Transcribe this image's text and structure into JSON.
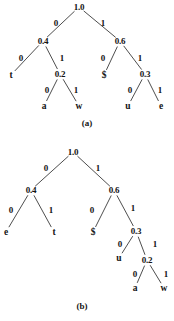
{
  "figure": {
    "name": "huffman-code-trees",
    "background": "#ffffff",
    "ink": "#141414",
    "edge_color": "#3a3a3a",
    "width": 174,
    "height": 321
  },
  "panels": [
    {
      "id": "a",
      "caption": "(a)",
      "caption_pos": {
        "x": 87,
        "y": 123
      },
      "nodes": [
        {
          "id": "a-root",
          "label": "1.0",
          "kind": "prob",
          "x": 79,
          "y": 7
        },
        {
          "id": "a-n04",
          "label": "0.4",
          "kind": "prob",
          "x": 43,
          "y": 41
        },
        {
          "id": "a-n06",
          "label": "0.6",
          "kind": "prob",
          "x": 120,
          "y": 41
        },
        {
          "id": "a-t",
          "label": "t",
          "kind": "symbol",
          "x": 11,
          "y": 75
        },
        {
          "id": "a-n02",
          "label": "0.2",
          "kind": "prob",
          "x": 60,
          "y": 74
        },
        {
          "id": "a-dollar",
          "label": "$",
          "kind": "symbol",
          "x": 104,
          "y": 75
        },
        {
          "id": "a-n03",
          "label": "0.3",
          "kind": "prob",
          "x": 145,
          "y": 74
        },
        {
          "id": "a-a",
          "label": "a",
          "kind": "symbol",
          "x": 44,
          "y": 106
        },
        {
          "id": "a-w",
          "label": "w",
          "kind": "symbol",
          "x": 79,
          "y": 106
        },
        {
          "id": "a-u",
          "label": "u",
          "kind": "symbol",
          "x": 128,
          "y": 106
        },
        {
          "id": "a-e",
          "label": "e",
          "kind": "symbol",
          "x": 161,
          "y": 106
        }
      ],
      "edges": [
        {
          "from": "a-root",
          "to": "a-n04",
          "bit": "0",
          "label_x": 56,
          "label_y": 23
        },
        {
          "from": "a-root",
          "to": "a-n06",
          "bit": "1",
          "label_x": 103,
          "label_y": 23
        },
        {
          "from": "a-n04",
          "to": "a-t",
          "bit": "0",
          "label_x": 21,
          "label_y": 58
        },
        {
          "from": "a-n04",
          "to": "a-n02",
          "bit": "1",
          "label_x": 62,
          "label_y": 58
        },
        {
          "from": "a-n06",
          "to": "a-dollar",
          "bit": "0",
          "label_x": 103,
          "label_y": 58
        },
        {
          "from": "a-n06",
          "to": "a-n03",
          "bit": "1",
          "label_x": 140,
          "label_y": 58
        },
        {
          "from": "a-n02",
          "to": "a-a",
          "bit": "0",
          "label_x": 47,
          "label_y": 90
        },
        {
          "from": "a-n02",
          "to": "a-w",
          "bit": "1",
          "label_x": 76,
          "label_y": 90
        },
        {
          "from": "a-n03",
          "to": "a-u",
          "bit": "0",
          "label_x": 130,
          "label_y": 90
        },
        {
          "from": "a-n03",
          "to": "a-e",
          "bit": "1",
          "label_x": 160,
          "label_y": 90
        }
      ]
    },
    {
      "id": "b",
      "caption": "(b)",
      "caption_pos": {
        "x": 82,
        "y": 306
      },
      "nodes": [
        {
          "id": "b-root",
          "label": "1.0",
          "kind": "prob",
          "x": 73,
          "y": 152
        },
        {
          "id": "b-n04",
          "label": "0.4",
          "kind": "prob",
          "x": 31,
          "y": 190
        },
        {
          "id": "b-n06",
          "label": "0.6",
          "kind": "prob",
          "x": 114,
          "y": 190
        },
        {
          "id": "b-e",
          "label": "e",
          "kind": "symbol",
          "x": 6,
          "y": 232
        },
        {
          "id": "b-t",
          "label": "t",
          "kind": "symbol",
          "x": 54,
          "y": 232
        },
        {
          "id": "b-dollar",
          "label": "$",
          "kind": "symbol",
          "x": 93,
          "y": 232
        },
        {
          "id": "b-n03",
          "label": "0.3",
          "kind": "prob",
          "x": 136,
          "y": 231
        },
        {
          "id": "b-u",
          "label": "u",
          "kind": "symbol",
          "x": 119,
          "y": 258
        },
        {
          "id": "b-n02",
          "label": "0.2",
          "kind": "prob",
          "x": 147,
          "y": 260
        },
        {
          "id": "b-a",
          "label": "a",
          "kind": "symbol",
          "x": 135,
          "y": 288
        },
        {
          "id": "b-w",
          "label": "w",
          "kind": "symbol",
          "x": 164,
          "y": 288
        }
      ],
      "edges": [
        {
          "from": "b-root",
          "to": "b-n04",
          "bit": "0",
          "label_x": 46,
          "label_y": 168
        },
        {
          "from": "b-root",
          "to": "b-n06",
          "bit": "1",
          "label_x": 98,
          "label_y": 168
        },
        {
          "from": "b-n04",
          "to": "b-e",
          "bit": "0",
          "label_x": 11,
          "label_y": 210
        },
        {
          "from": "b-n04",
          "to": "b-t",
          "bit": "1",
          "label_x": 51,
          "label_y": 210
        },
        {
          "from": "b-n06",
          "to": "b-dollar",
          "bit": "0",
          "label_x": 92,
          "label_y": 210
        },
        {
          "from": "b-n06",
          "to": "b-n03",
          "bit": "1",
          "label_x": 133,
          "label_y": 208
        },
        {
          "from": "b-n03",
          "to": "b-u",
          "bit": "0",
          "label_x": 120,
          "label_y": 244
        },
        {
          "from": "b-n03",
          "to": "b-n02",
          "bit": "1",
          "label_x": 155,
          "label_y": 244
        },
        {
          "from": "b-n02",
          "to": "b-a",
          "bit": "0",
          "label_x": 135,
          "label_y": 274
        },
        {
          "from": "b-n02",
          "to": "b-w",
          "bit": "1",
          "label_x": 166,
          "label_y": 274
        }
      ]
    }
  ],
  "chart_data": {
    "type": "diagram",
    "trees": [
      {
        "panel": "(a)",
        "root": "1.0",
        "codes": [
          {
            "symbol": "t",
            "code": "00",
            "probability": null
          },
          {
            "symbol": "a",
            "code": "010",
            "probability": null
          },
          {
            "symbol": "w",
            "code": "011",
            "probability": null
          },
          {
            "symbol": "$",
            "code": "10",
            "probability": null
          },
          {
            "symbol": "u",
            "code": "110",
            "probability": null
          },
          {
            "symbol": "e",
            "code": "111",
            "probability": null
          }
        ],
        "internal_nodes": [
          "1.0",
          "0.4",
          "0.6",
          "0.2",
          "0.3"
        ]
      },
      {
        "panel": "(b)",
        "root": "1.0",
        "codes": [
          {
            "symbol": "e",
            "code": "00",
            "probability": null
          },
          {
            "symbol": "t",
            "code": "01",
            "probability": null
          },
          {
            "symbol": "$",
            "code": "10",
            "probability": null
          },
          {
            "symbol": "u",
            "code": "110",
            "probability": null
          },
          {
            "symbol": "a",
            "code": "1110",
            "probability": null
          },
          {
            "symbol": "w",
            "code": "1111",
            "probability": null
          }
        ],
        "internal_nodes": [
          "1.0",
          "0.4",
          "0.6",
          "0.3",
          "0.2"
        ]
      }
    ]
  }
}
